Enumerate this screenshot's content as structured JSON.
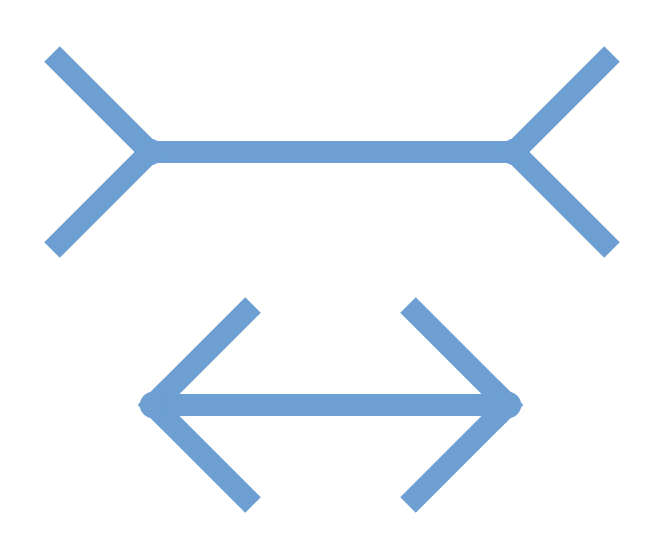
{
  "stroke_color": "#6d9fd3",
  "background": "#ffffff",
  "stroke_width": 22,
  "figures": [
    {
      "name": "fins-out",
      "shaft": {
        "x1": 140,
        "y1": 152,
        "x2": 518,
        "y2": 152
      },
      "fins": [
        {
          "x1": 52,
          "y1": 54,
          "x2": 150,
          "y2": 152
        },
        {
          "x1": 52,
          "y1": 250,
          "x2": 150,
          "y2": 152
        },
        {
          "x1": 612,
          "y1": 54,
          "x2": 514,
          "y2": 152
        },
        {
          "x1": 612,
          "y1": 250,
          "x2": 514,
          "y2": 152
        }
      ]
    },
    {
      "name": "fins-in",
      "shaft": {
        "x1": 160,
        "y1": 405,
        "x2": 505,
        "y2": 405
      },
      "fins": [
        {
          "x1": 253,
          "y1": 305,
          "x2": 153,
          "y2": 405
        },
        {
          "x1": 253,
          "y1": 505,
          "x2": 153,
          "y2": 405
        },
        {
          "x1": 408,
          "y1": 305,
          "x2": 508,
          "y2": 405
        },
        {
          "x1": 408,
          "y1": 505,
          "x2": 508,
          "y2": 405
        }
      ]
    }
  ]
}
